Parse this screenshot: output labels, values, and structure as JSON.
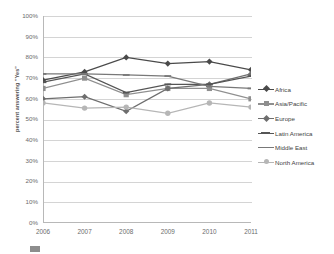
{
  "chart_data": {
    "type": "line",
    "title": "",
    "subtitle": "",
    "xlabel": "",
    "ylabel": "percent answering \"Yes\"",
    "categories": [
      "2006",
      "2007",
      "2008",
      "2009",
      "2010",
      "2011"
    ],
    "x": [
      2006,
      2007,
      2008,
      2009,
      2010,
      2011
    ],
    "ylim": [
      0,
      100
    ],
    "xlim": [
      2006,
      2011
    ],
    "y_tick_labels": [
      "0%",
      "10%",
      "20%",
      "30%",
      "40%",
      "50%",
      "60%",
      "70%",
      "80%",
      "90%",
      "100%"
    ],
    "y_tick_values": [
      0,
      10,
      20,
      30,
      40,
      50,
      60,
      70,
      80,
      90,
      100
    ],
    "x_tick_labels": [
      "2006",
      "2007",
      "2008",
      "2009",
      "2010",
      "2011"
    ],
    "grid": "horizontal",
    "legend_position": "right",
    "value_suffix": "%",
    "series": [
      {
        "name": "Africa",
        "marker": "diamond",
        "color": "#4a4a4a",
        "values": [
          69,
          73,
          80,
          77,
          78,
          74
        ]
      },
      {
        "name": "Asia/Pacific",
        "marker": "square",
        "color": "#8f8f8f",
        "values": [
          65,
          70,
          62,
          65,
          65,
          60
        ]
      },
      {
        "name": "Europe",
        "marker": "diamond",
        "color": "#6e6e6e",
        "values": [
          60,
          61,
          54,
          65,
          67,
          72
        ]
      },
      {
        "name": "Latin America",
        "marker": "line",
        "color": "#555555",
        "values": [
          68,
          72,
          63,
          67,
          67,
          71
        ]
      },
      {
        "name": "Middle East",
        "marker": "line",
        "color": "#787878",
        "values": [
          72,
          72,
          71.5,
          71,
          66,
          65
        ]
      },
      {
        "name": "North America",
        "marker": "circle",
        "color": "#b6b6b6",
        "values": [
          58,
          55.5,
          56,
          53,
          58,
          56
        ]
      }
    ]
  },
  "legend": {
    "items": [
      {
        "label": "Africa"
      },
      {
        "label": "Asia/Pacific"
      },
      {
        "label": "Europe"
      },
      {
        "label": "Latin America"
      },
      {
        "label": "Middle East"
      },
      {
        "label": "North America"
      }
    ]
  },
  "axis": {
    "y_title": "percent answering \"Yes\""
  },
  "bottom_caption": {
    "text": ""
  }
}
